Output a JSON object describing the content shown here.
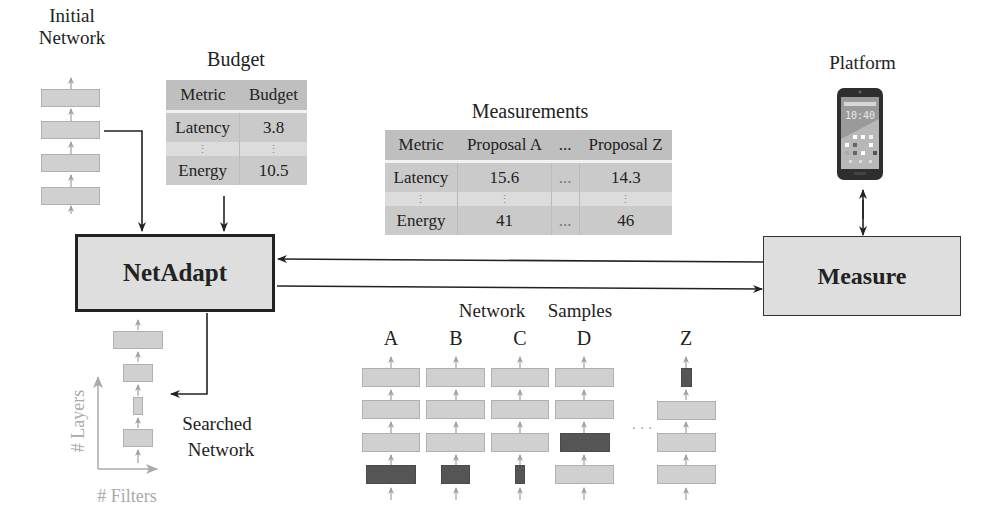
{
  "initial_network": {
    "label_line1": "Initial",
    "label_line2": "Network",
    "layer_count": 4
  },
  "budget": {
    "title": "Budget",
    "headers": [
      "Metric",
      "Budget"
    ],
    "rows": [
      [
        "Latency",
        "3.8"
      ],
      [
        "⋮",
        "⋮"
      ],
      [
        "Energy",
        "10.5"
      ]
    ]
  },
  "measurements": {
    "title": "Measurements",
    "headers": [
      "Metric",
      "Proposal A",
      "...",
      "Proposal Z"
    ],
    "rows": [
      [
        "Latency",
        "15.6",
        "...",
        "14.3"
      ],
      [
        "⋮",
        "⋮",
        "",
        "⋮"
      ],
      [
        "Energy",
        "41",
        "...",
        "46"
      ]
    ]
  },
  "platform": {
    "title": "Platform",
    "phone_time": "10:40",
    "icon": "smartphone-icon"
  },
  "netadapt_box": {
    "label": "NetAdapt"
  },
  "measure_box": {
    "label": "Measure"
  },
  "network_samples": {
    "title_word1": "Network",
    "title_word2": "Samples",
    "samples": [
      {
        "name": "A"
      },
      {
        "name": "B"
      },
      {
        "name": "C"
      },
      {
        "name": "D"
      },
      {
        "name": "Z"
      }
    ],
    "ellipsis": "· · ·"
  },
  "searched_network": {
    "label_line1": "Searched",
    "label_line2": "Network",
    "y_axis_label": "# Layers",
    "x_axis_label": "# Filters"
  },
  "colors": {
    "box_fill": "#dedede",
    "layer_fill": "#d0d0d0",
    "pruned_layer_fill": "#555555",
    "table_fill": "#c4c4c4",
    "axis_gray": "#aaaaaa"
  }
}
